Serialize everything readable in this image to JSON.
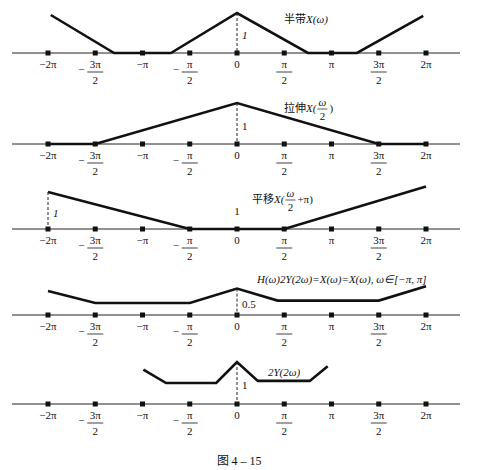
{
  "figure_caption": "图 4 – 15",
  "tick_labels": [
    {
      "num": "−2π",
      "den": null,
      "sign": ""
    },
    {
      "num": "3π",
      "den": "2",
      "sign": "−"
    },
    {
      "num": "−π",
      "den": null,
      "sign": ""
    },
    {
      "num": "π",
      "den": "2",
      "sign": "−"
    },
    {
      "num": "0",
      "den": null,
      "sign": ""
    },
    {
      "num": "π",
      "den": "2",
      "sign": ""
    },
    {
      "num": "π",
      "den": null,
      "sign": ""
    },
    {
      "num": "3π",
      "den": "2",
      "sign": ""
    },
    {
      "num": "2π",
      "den": null,
      "sign": ""
    }
  ],
  "tick_values_over_pi": [
    -2,
    -1.5,
    -1,
    -0.5,
    0,
    0.5,
    1,
    1.5,
    2
  ],
  "panels": [
    {
      "name": "half-band",
      "label_cn": "半带",
      "label_math": "X(ω)",
      "height_label": "1",
      "height_label_x_over_pi": 0,
      "points": [
        [
          -1.97,
          0.95
        ],
        [
          -1.3,
          0
        ],
        [
          -0.7,
          0
        ],
        [
          0,
          1
        ],
        [
          0.75,
          0
        ],
        [
          1.27,
          0
        ],
        [
          1.97,
          0.93
        ]
      ]
    },
    {
      "name": "stretch",
      "label_cn": "拉伸",
      "label_math_pre": "X(",
      "label_frac_num": "ω",
      "label_frac_den": "2",
      "label_math_post": ")",
      "height_label": "1",
      "height_label_x_over_pi": 0,
      "points": [
        [
          -2,
          0
        ],
        [
          -1.5,
          0
        ],
        [
          0,
          1
        ],
        [
          1.5,
          0
        ],
        [
          2,
          0
        ]
      ]
    },
    {
      "name": "shift",
      "label_cn": "平移",
      "label_math_pre": "X(",
      "label_frac_num": "ω",
      "label_frac_den": "2",
      "label_math_post": "+π)",
      "height_label": "1",
      "height_label_x_over_pi": -2,
      "extra_label": "1",
      "points": [
        [
          -2,
          1
        ],
        [
          -0.5,
          0
        ],
        [
          0.5,
          0
        ],
        [
          2,
          1.15
        ]
      ]
    },
    {
      "name": "sum",
      "label_math": "H(ω)2Y(2ω)=X(ω)=X(ω), ω∈[−π, π]",
      "height_label": "0.5",
      "height_label_x_over_pi": 0,
      "points": [
        [
          -2,
          1
        ],
        [
          -1.5,
          0.5
        ],
        [
          -0.5,
          0.5
        ],
        [
          0,
          1.1
        ],
        [
          0.43,
          0.6
        ],
        [
          1.5,
          0.6
        ],
        [
          2,
          1.2
        ]
      ]
    },
    {
      "name": "result",
      "label_math": "2Y(2ω)",
      "height_label": "1",
      "height_label_x_over_pi": 0,
      "points": [
        [
          -0.99,
          0.82
        ],
        [
          -0.75,
          0.5
        ],
        [
          -0.22,
          0.5
        ],
        [
          0,
          1.0
        ],
        [
          0.22,
          0.55
        ],
        [
          0.77,
          0.55
        ],
        [
          0.96,
          0.9
        ]
      ]
    }
  ]
}
